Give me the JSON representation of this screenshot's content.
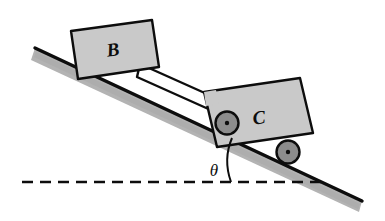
{
  "figure": {
    "background_color": "#ffffff",
    "line_color": "#0d0d0d",
    "body_fill": "#c9c9c9",
    "incline_shadow_color": "#b3b3b3",
    "wheel_fill": "#8c8c8c",
    "width": 385,
    "height": 221
  },
  "labels": {
    "block_b": "B",
    "cart_c": "C",
    "angle": "θ"
  },
  "incline": {
    "name": "incline-surface",
    "angle_degrees": 25,
    "start_x": 35,
    "start_y": 48,
    "end_x": 362,
    "end_y": 201,
    "thickness": 11
  },
  "horizontal_reference": {
    "name": "horizontal-dashed-line",
    "y": 182,
    "start_x": 22,
    "end_x": 322,
    "dash_pattern": "10 7"
  },
  "block_b": {
    "name": "block-b",
    "label": "B",
    "fill": "#c9c9c9",
    "corners": "71,31 152,20 159,67 78,79"
  },
  "connecting_rod": {
    "name": "connecting-rod",
    "fill": "#ffffff"
  },
  "cart_c": {
    "name": "cart-c",
    "label": "C",
    "fill": "#c9c9c9",
    "corners": "204,92 300,78 313,133 217,147"
  },
  "wheels": [
    {
      "name": "wheel-front",
      "cx": 227,
      "cy": 123,
      "r": 11.5,
      "hub_r": 2.2,
      "fill": "#8c8c8c"
    },
    {
      "name": "wheel-rear",
      "cx": 288,
      "cy": 152,
      "r": 11.5,
      "hub_r": 2.2,
      "fill": "#8c8c8c"
    }
  ],
  "angle_marker": {
    "name": "angle-arc",
    "vertex_x": 232,
    "vertex_y": 182,
    "label": "θ",
    "label_x": 215,
    "label_y": 171
  }
}
